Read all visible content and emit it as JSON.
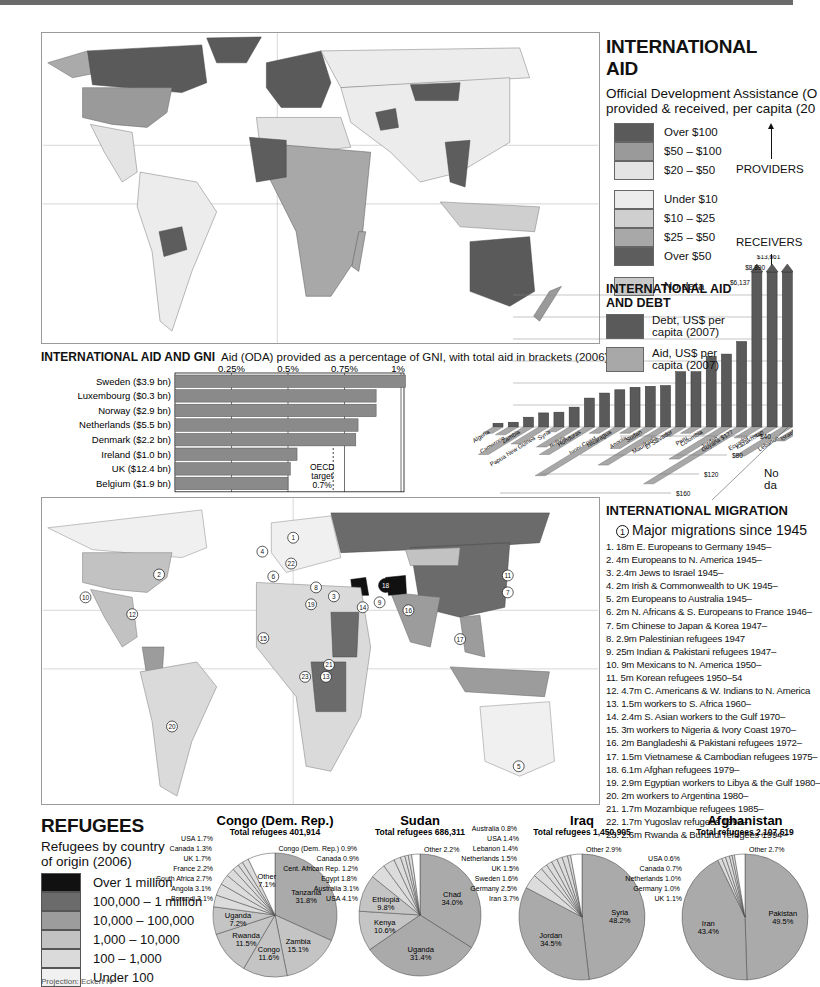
{
  "header": {
    "band_color": "#6a6a6a"
  },
  "maps": {
    "aid_map": {
      "name": "International aid choropleth world map"
    },
    "migration_map": {
      "name": "International migration & refugees world map",
      "markers": [
        "1",
        "2",
        "3",
        "4",
        "5",
        "6",
        "6",
        "7",
        "8",
        "9",
        "10",
        "11",
        "12",
        "13",
        "14",
        "15",
        "16",
        "17",
        "18",
        "19",
        "20",
        "21",
        "22",
        "23"
      ]
    }
  },
  "aid_legend": {
    "title": "INTERNATIONAL AID",
    "subtitle_line1": "Official Development Assistance (O",
    "subtitle_line2": "provided & received, per capita (20",
    "providers": [
      {
        "label": "Over $100",
        "color": "#5a5a5a"
      },
      {
        "label": "$50 – $100",
        "color": "#9a9a9a"
      },
      {
        "label": "$20 – $50",
        "color": "#e4e4e4"
      }
    ],
    "providers_label": "PROVIDERS",
    "receivers": [
      {
        "label": "Under $10",
        "color": "#ececec"
      },
      {
        "label": "$10 – $25",
        "color": "#cfcfcf"
      },
      {
        "label": "$25 – $50",
        "color": "#a8a8a8"
      },
      {
        "label": "Over $50",
        "color": "#5d5d5d"
      }
    ],
    "receivers_label": "RECEIVERS",
    "no_data": {
      "label": "No data",
      "color": "#c8c8c8"
    }
  },
  "gni": {
    "title": "INTERNATIONAL AID AND GNI",
    "subtitle": "Aid (ODA) provided as a percentage of GNI, with total aid in brackets (2006).",
    "oecd_line1": "OECD",
    "oecd_line2": "target",
    "oecd_line3": "0.7%"
  },
  "debt_legend": {
    "title_line1": "INTERNATIONAL AID",
    "title_line2": "AND DEBT",
    "debt_label_1": "Debt, US$ per",
    "debt_label_2": "capita (2007)",
    "aid_label_1": "Aid, US$ per",
    "aid_label_2": "capita (2007)",
    "no_data": "No da"
  },
  "migration": {
    "title": "INTERNATIONAL MIGRATION",
    "marker_label": "1",
    "heading": "Major migrations since 1945",
    "items": [
      "1. 18m E. Europeans to Germany 1945–",
      "2. 4m Europeans to N. America 1945–",
      "3. 2.4m Jews to Israel 1945–",
      "4. 2m Irish & Commonwealth to UK 1945–",
      "5. 2m Europeans to Australia 1945–",
      "6. 2m N. Africans & S. Europeans to France 1946–",
      "7. 5m Chinese to Japan & Korea 1947–",
      "8. 2.9m Palestinian refugees 1947",
      "9. 25m Indian & Pakistani refugees 1947–",
      "10. 9m Mexicans to N. America 1950–",
      "11. 5m Korean refugees 1950–54",
      "12. 4.7m C. Americans & W. Indians to N. America",
      "13. 1.5m workers to S. Africa 1960–",
      "14. 2.4m S. Asian workers to the Gulf 1970–",
      "15. 3m workers to Nigeria & Ivory Coast 1970–",
      "16. 2m Bangladeshi & Pakistani refugees 1972–",
      "17. 1.5m Vietnamese & Cambodian refugees 1975–",
      "18. 6.1m Afghan refugees 1979–",
      "19. 2.9m Egyptian workers to Libya & the Gulf 1980–",
      "20. 2m workers to Argentina 1980–",
      "21. 1.7m Mozambique refugees 1985–",
      "22. 1.7m Yugoslav refugees 1992–",
      "23. 2.6m Rwanda & Burundi refugees 1994–"
    ]
  },
  "refugees": {
    "title": "REFUGEES",
    "subtitle_line1": "Refugees by country",
    "subtitle_line2": "of origin (2006)",
    "legend": [
      {
        "label": "Over 1 million",
        "color": "#111111"
      },
      {
        "label": "100,000 – 1 million",
        "color": "#6b6b6b"
      },
      {
        "label": "10,000 – 100,000",
        "color": "#9c9c9c"
      },
      {
        "label": "1,000 – 10,000",
        "color": "#c2c2c2"
      },
      {
        "label": "100 – 1,000",
        "color": "#dadada"
      },
      {
        "label": "Under 100",
        "color": "#f0f0f0"
      }
    ],
    "projection": "Projection: Eckert IV"
  },
  "chart_data": [
    {
      "type": "bar",
      "orientation": "horizontal",
      "title": "INTERNATIONAL AID AND GNI",
      "subtitle": "Aid (ODA) provided as a percentage of GNI, with total aid in brackets (2006).",
      "categories": [
        "Sweden ($3.9 bn)",
        "Luxembourg ($0.3 bn)",
        "Norway ($2.9 bn)",
        "Netherlands ($5.5 bn)",
        "Denmark ($2.2 bn)",
        "Ireland ($1.0 bn)",
        "UK ($12.4 bn)",
        "Belgium ($1.9 bn)"
      ],
      "values": [
        1.02,
        0.89,
        0.89,
        0.81,
        0.8,
        0.54,
        0.51,
        0.5
      ],
      "xticks": [
        "0.25%",
        "0.5%",
        "0.75%",
        "1%"
      ],
      "xtick_values": [
        0.25,
        0.5,
        0.75,
        1.0
      ],
      "xlim": [
        0,
        1.05
      ],
      "reference_line": {
        "value": 0.7,
        "label": "OECD target 0.7%"
      },
      "bar_color": "#8a8a8a"
    },
    {
      "type": "bar",
      "title": "INTERNATIONAL AID AND DEBT",
      "categories": [
        "Algeria",
        "Cameroon",
        "Zambia",
        "Papua New Guinea",
        "Syria",
        "Bolivia",
        "Honduras",
        "Ivory Coast",
        "Nicaragua",
        "Angola",
        "Sudan",
        "Mauritania",
        "El Salvador",
        "Peru",
        "Colombia",
        "Jordan",
        "Guyana $177",
        "Ecuador",
        "Kazakhstan",
        "Lebanon",
        "Israel"
      ],
      "series": [
        {
          "name": "Debt, US$ per capita (2007)",
          "color": "#5a5a5a",
          "values": [
            150,
            190,
            390,
            560,
            590,
            790,
            1150,
            1350,
            1480,
            1580,
            1620,
            1650,
            2200,
            2200,
            2800,
            2900,
            3400,
            6137,
            8890,
            13661,
            0
          ]
        },
        {
          "name": "Aid, US$ per capita (2007)",
          "color": "#a8a8a8",
          "values": [
            10,
            15,
            80,
            45,
            5,
            55,
            80,
            10,
            150,
            10,
            60,
            115,
            20,
            10,
            15,
            95,
            177,
            25,
            20,
            85,
            35
          ]
        }
      ],
      "annotations": [
        "$6,137",
        "$8,890",
        "$13,661"
      ],
      "aid_axis_ticks": [
        "$40",
        "$80",
        "$120",
        "$160"
      ]
    },
    {
      "type": "pie",
      "title": "Congo (Dem. Rep.)",
      "subtitle": "Total refugees 401,914",
      "slices": [
        {
          "label": "Tanzania",
          "value": 31.8
        },
        {
          "label": "Zambia",
          "value": 15.1
        },
        {
          "label": "Congo",
          "value": 11.6
        },
        {
          "label": "Rwanda",
          "value": 11.5
        },
        {
          "label": "Uganda",
          "value": 7.2
        },
        {
          "label": "Burundi",
          "value": 3.1
        },
        {
          "label": "Angola",
          "value": 3.1
        },
        {
          "label": "South Africa",
          "value": 2.7
        },
        {
          "label": "France",
          "value": 2.2
        },
        {
          "label": "UK",
          "value": 1.7
        },
        {
          "label": "Canada",
          "value": 1.3
        },
        {
          "label": "USA",
          "value": 1.7
        },
        {
          "label": "Other",
          "value": 7.1
        }
      ]
    },
    {
      "type": "pie",
      "title": "Sudan",
      "subtitle": "Total refugees 686,311",
      "slices": [
        {
          "label": "Chad",
          "value": 34.0
        },
        {
          "label": "Uganda",
          "value": 31.4
        },
        {
          "label": "Kenya",
          "value": 10.6
        },
        {
          "label": "Ethiopia",
          "value": 9.8
        },
        {
          "label": "USA",
          "value": 4.1
        },
        {
          "label": "Australia",
          "value": 3.1
        },
        {
          "label": "Egypt",
          "value": 1.8
        },
        {
          "label": "Cent. African Rep.",
          "value": 1.2
        },
        {
          "label": "Canada",
          "value": 0.9
        },
        {
          "label": "Congo (Dem. Rep.)",
          "value": 0.9
        },
        {
          "label": "Other",
          "value": 2.2
        }
      ]
    },
    {
      "type": "pie",
      "title": "Iraq",
      "subtitle": "Total refugees 1,450,905",
      "slices": [
        {
          "label": "Syria",
          "value": 48.2
        },
        {
          "label": "Jordan",
          "value": 34.5
        },
        {
          "label": "Iran",
          "value": 3.7
        },
        {
          "label": "Germany",
          "value": 2.5
        },
        {
          "label": "Sweden",
          "value": 1.6
        },
        {
          "label": "UK",
          "value": 1.5
        },
        {
          "label": "Netherlands",
          "value": 1.5
        },
        {
          "label": "Lebanon",
          "value": 1.4
        },
        {
          "label": "USA",
          "value": 1.4
        },
        {
          "label": "Australia",
          "value": 0.8
        },
        {
          "label": "Other",
          "value": 2.9
        }
      ]
    },
    {
      "type": "pie",
      "title": "Afghanistan",
      "subtitle": "Total refugees 2,107,519",
      "slices": [
        {
          "label": "Pakistan",
          "value": 49.5
        },
        {
          "label": "Iran",
          "value": 43.4
        },
        {
          "label": "UK",
          "value": 1.1
        },
        {
          "label": "Germany",
          "value": 1.0
        },
        {
          "label": "Netherlands",
          "value": 1.0
        },
        {
          "label": "Canada",
          "value": 0.7
        },
        {
          "label": "USA",
          "value": 0.6
        },
        {
          "label": "Other",
          "value": 2.7
        }
      ]
    }
  ]
}
